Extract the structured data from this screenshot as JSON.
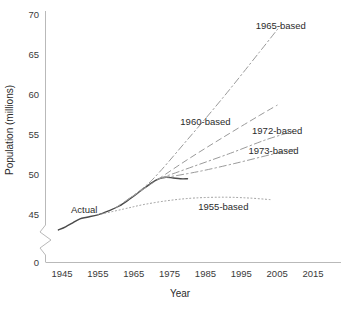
{
  "chart_data": {
    "type": "line",
    "title": "",
    "xlabel": "Year",
    "ylabel": "Population (millions)",
    "xlim": [
      1940,
      2019
    ],
    "ylim": [
      43,
      71
    ],
    "y_axis_break": true,
    "y_break_note": "axis broken between 0 and ~43",
    "grid": false,
    "legend_position": "inline-annotations",
    "xticks": [
      1945,
      1955,
      1965,
      1975,
      1985,
      1995,
      2005,
      2015
    ],
    "xtick_labels": [
      "1945",
      "1955",
      "1965",
      "1975",
      "1985",
      "1995",
      "2005",
      "2015"
    ],
    "yticks": [
      0,
      45,
      50,
      55,
      60,
      65,
      70
    ],
    "ytick_labels": [
      "0",
      "45",
      "50",
      "55",
      "60",
      "65",
      "70"
    ],
    "series": [
      {
        "name": "Actual",
        "label": "Actual",
        "style": "solid",
        "color": "#4a4a4a",
        "label_x": 1947.5,
        "label_y": 45.6,
        "x": [
          1944,
          1946,
          1948,
          1950,
          1952,
          1955,
          1958,
          1961,
          1964,
          1967,
          1970,
          1972,
          1974,
          1976,
          1978,
          1980
        ],
        "y": [
          43.0,
          43.4,
          43.9,
          44.4,
          44.6,
          44.9,
          45.4,
          46.0,
          46.9,
          47.9,
          48.9,
          49.4,
          49.6,
          49.5,
          49.4,
          49.4
        ]
      },
      {
        "name": "1955-based",
        "label": "1955-based",
        "style": "dotted",
        "color": "#9a9a9a",
        "label_x": 1990,
        "label_y": 45.9,
        "x": [
          1955,
          1962,
          1968,
          1975,
          1982,
          1990,
          1997,
          2003
        ],
        "y": [
          44.9,
          45.6,
          46.2,
          46.7,
          47.0,
          47.1,
          47.0,
          46.8
        ]
      },
      {
        "name": "1960-based",
        "label": "1960-based",
        "style": "dashed",
        "color": "#9a9a9a",
        "label_x": 1985,
        "label_y": 56.6,
        "x": [
          1960,
          1970,
          1980,
          1990,
          2000,
          2005
        ],
        "y": [
          45.8,
          48.8,
          51.8,
          54.6,
          57.3,
          58.6
        ]
      },
      {
        "name": "1965-based",
        "label": "1965-based",
        "style": "dashdot",
        "color": "#9a9a9a",
        "label_x": 2006,
        "label_y": 68.6,
        "x": [
          1963,
          1970,
          1980,
          1990,
          2000,
          2006
        ],
        "y": [
          46.7,
          49.2,
          54.3,
          59.6,
          65.2,
          68.6
        ]
      },
      {
        "name": "1972-based",
        "label": "1972-based",
        "style": "dashdot",
        "color": "#9a9a9a",
        "label_x": 2005,
        "label_y": 55.4,
        "x": [
          1972,
          1982,
          1992,
          2002,
          2010
        ],
        "y": [
          49.4,
          51.0,
          52.6,
          54.3,
          55.4
        ]
      },
      {
        "name": "1973-based",
        "label": "1973-based",
        "style": "dashdot",
        "color": "#9a9a9a",
        "label_x": 2004,
        "label_y": 53.0,
        "x": [
          1973,
          1983,
          1993,
          2003,
          2010
        ],
        "y": [
          49.5,
          50.3,
          51.3,
          52.4,
          53.1
        ]
      }
    ]
  },
  "axes": {
    "x_title": "Year",
    "y_title": "Population (millions)"
  },
  "colors": {
    "axis": "#b9b9b9",
    "text": "#2b2b2b",
    "actual": "#4a4a4a",
    "projection": "#9a9a9a",
    "background": "#ffffff"
  }
}
